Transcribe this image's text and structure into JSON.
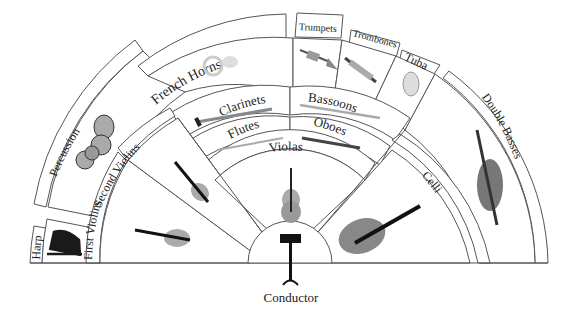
{
  "diagram": {
    "center_label": "Conductor",
    "sections": {
      "harp": "Harp",
      "percussion": "Percussion",
      "french_horns": "French Horns",
      "trumpets": "Trumpets",
      "trombones": "Trombones",
      "tuba": "Tuba",
      "double_basses": "Double Basses",
      "clarinets": "Clarinets",
      "bassoons": "Bassoons",
      "flutes": "Flutes",
      "oboes": "Oboes",
      "violas": "Violas",
      "first_violins": "First Violins",
      "second_violins": "Second Violins",
      "celli": "Celli"
    },
    "icons": {
      "harp": "harp-icon",
      "percussion": "timpani-icon",
      "french_horns": "french-horn-icon",
      "trumpets": "trumpet-icon",
      "trombones": "trombone-icon",
      "tuba": "tuba-icon",
      "double_basses": "double-bass-icon",
      "clarinets": "clarinet-icon",
      "bassoons": "bassoon-icon",
      "flutes": "flute-icon",
      "oboes": "oboe-icon",
      "violas": "viola-icon",
      "first_violins": "violin-icon",
      "second_violins": "violin-icon",
      "celli": "cello-icon",
      "conductor": "music-stand-icon"
    },
    "colors": {
      "outline": "#555555",
      "text": "#222222",
      "background": "#ffffff"
    }
  }
}
